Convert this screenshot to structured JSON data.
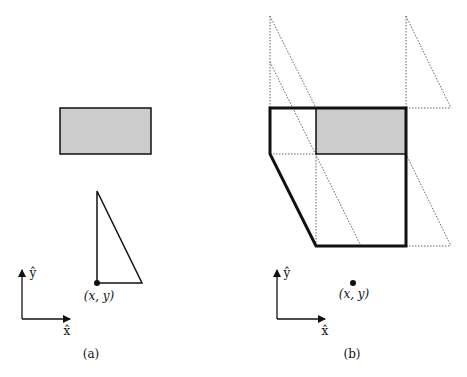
{
  "panel_a": {
    "caption": "(a)",
    "point_label": "(x, y)",
    "axis_x_label": "x̂",
    "axis_y_label": "ŷ"
  },
  "panel_b": {
    "caption": "(b)",
    "point_label": "(x, y)",
    "axis_x_label": "x̂",
    "axis_y_label": "ŷ"
  },
  "colors": {
    "stroke": "#111111",
    "fill_gray": "#cccccc",
    "dotted": "#555555"
  }
}
